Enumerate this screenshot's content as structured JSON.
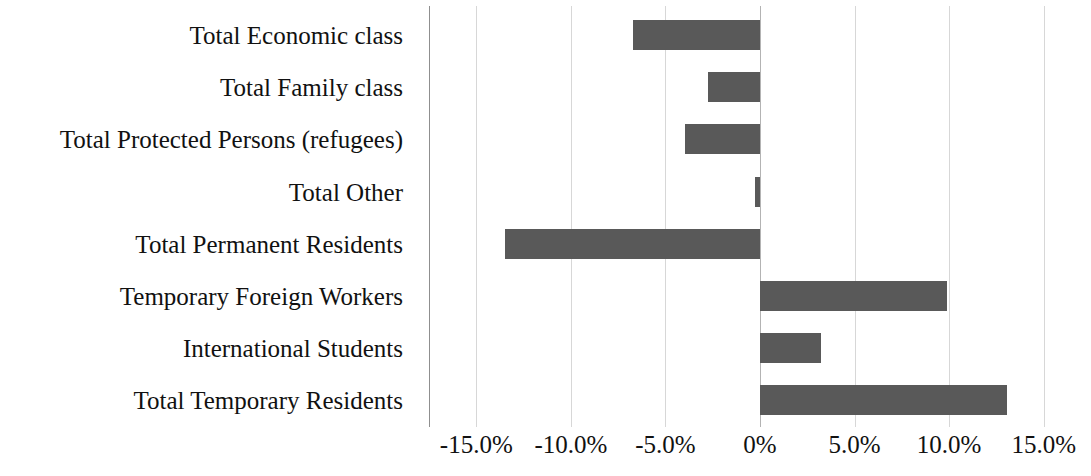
{
  "chart_data": {
    "type": "bar",
    "orientation": "horizontal",
    "title": "",
    "subtitle": "",
    "xlabel": "",
    "ylabel": "",
    "grid": true,
    "legend": false,
    "bar_color": "#595959",
    "gridline_color": "#d7d7d7",
    "axis_color": "#8f8f8f",
    "xlim": [
      -17.5,
      17.5
    ],
    "xtick_values": [
      -15.0,
      -10.0,
      -5.0,
      0,
      5.0,
      10.0,
      15.0
    ],
    "xtick_labels": [
      "-15.0%",
      "-10.0%",
      "-5.0%",
      "0%",
      "5.0%",
      "10.0%",
      "15.0%"
    ],
    "categories": [
      "Total Economic class",
      "Total Family class",
      "Total Protected Persons (refugees)",
      "Total Other",
      "Total Permanent Residents",
      "Temporary Foreign Workers",
      "International Students",
      "Total Temporary Residents"
    ],
    "values": [
      -6.7,
      -2.75,
      -3.95,
      -0.25,
      -13.5,
      9.9,
      3.2,
      13.05
    ]
  }
}
